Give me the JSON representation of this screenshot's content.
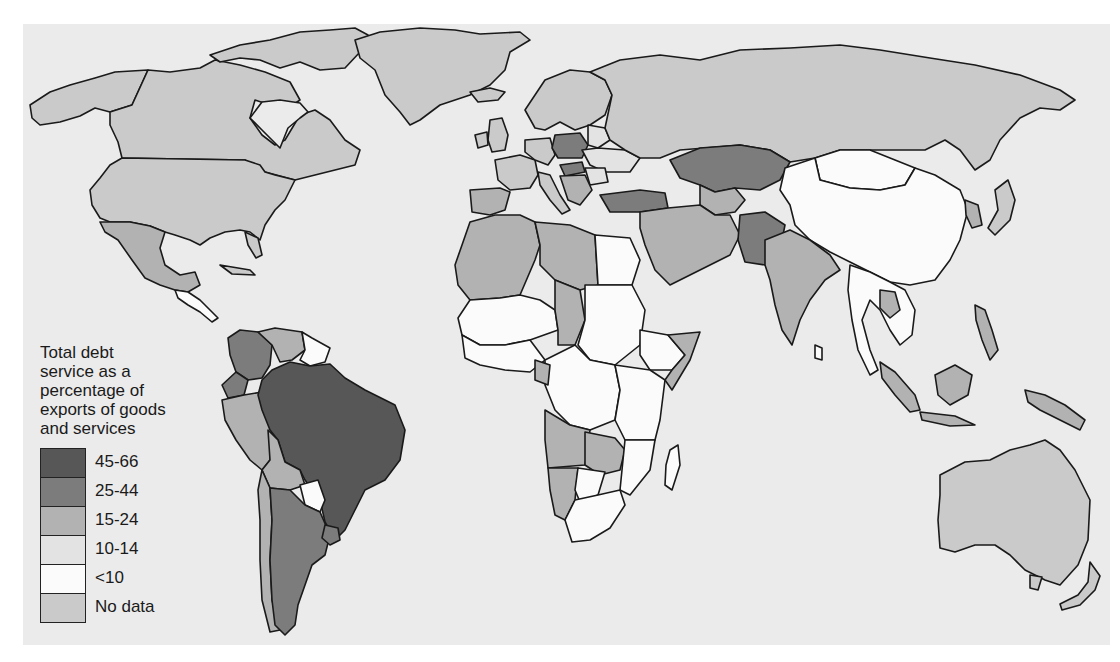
{
  "legend": {
    "title_lines": [
      "Total debt",
      "service as a",
      "percentage of",
      "exports of goods",
      "and services"
    ],
    "items": [
      {
        "label": "45-66",
        "color": "#575757"
      },
      {
        "label": "25-44",
        "color": "#7c7c7c"
      },
      {
        "label": "15-24",
        "color": "#b2b2b2"
      },
      {
        "label": "10-14",
        "color": "#e3e3e3"
      },
      {
        "label": "<10",
        "color": "#fbfbfb"
      },
      {
        "label": "No data",
        "color": "#cacaca"
      }
    ]
  },
  "map": {
    "background_color": "#ebebeb",
    "regions": {
      "no_data": [
        "Canada",
        "United States",
        "Greenland",
        "Russia",
        "Australia",
        "Western Europe",
        "Scandinavia",
        "Japan"
      ],
      "45-66": [
        "Brazil"
      ],
      "25-44": [
        "Argentina",
        "Colombia",
        "Ecuador",
        "Uruguay",
        "Kazakhstan",
        "Turkey",
        "Poland",
        "Hungary",
        "Uzbekistan",
        "Pakistan"
      ],
      "15-24": [
        "Mexico",
        "Venezuela",
        "Peru",
        "Chile",
        "Bolivia",
        "India",
        "Indonesia",
        "Algeria",
        "Libya",
        "Morocco",
        "Mauritania",
        "Chad",
        "Angola",
        "Namibia",
        "Zambia",
        "Zimbabwe",
        "Cameroon",
        "Somalia",
        "Iran",
        "Saudi Arabia",
        "Afghanistan",
        "Thailand",
        "Philippines",
        "Papua New Guinea",
        "South Korea",
        "Sri Lanka"
      ],
      "10-14": [
        "Belarus",
        "Ukraine",
        "Romania"
      ],
      "<10": [
        "China",
        "Mongolia",
        "Egypt",
        "Sudan",
        "Ethiopia",
        "DR Congo",
        "Niger",
        "Mali",
        "Nigeria",
        "Tanzania",
        "Kenya",
        "South Africa",
        "Botswana",
        "Mozambique",
        "Madagascar",
        "Paraguay",
        "Guyana",
        "Suriname",
        "Vietnam",
        "Myanmar",
        "Malaysia"
      ]
    }
  }
}
